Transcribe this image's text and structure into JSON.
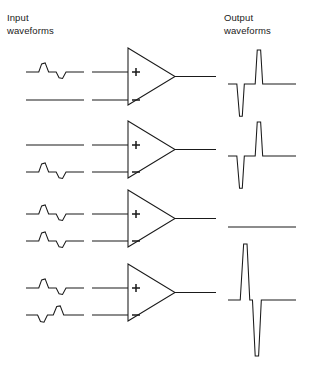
{
  "headers": {
    "input": "Input\nwaveforms",
    "output": "Output\nwaveforms"
  },
  "symbols": {
    "plus": "+",
    "minus": "−",
    "amplifier_name": "operational-amplifier"
  },
  "colors": {
    "stroke": "#1a1a1a",
    "background": "#ffffff",
    "text": "#1a1a1a"
  },
  "chart_data": {
    "type": "line",
    "subtitle": "Differential amplifier response to four input conditions",
    "xlabel": "time",
    "ylabel": "amplitude",
    "grid": false,
    "legend": "none",
    "axis_ranges": {
      "x": [
        0,
        1
      ],
      "y": [
        -1,
        1
      ]
    },
    "rows": [
      {
        "row": 1,
        "label": "signal on non-inverting input only",
        "inputs": [
          {
            "terminal": "+",
            "name": "plus-input-waveform",
            "description": "positive pulse followed by negative pulse",
            "points": [
              [
                0.0,
                0.0
              ],
              [
                0.22,
                0.0
              ],
              [
                0.27,
                0.62
              ],
              [
                0.33,
                0.7
              ],
              [
                0.39,
                0.0
              ],
              [
                0.52,
                0.0
              ],
              [
                0.57,
                -0.45
              ],
              [
                0.63,
                -0.5
              ],
              [
                0.69,
                0.0
              ],
              [
                1.0,
                0.0
              ]
            ]
          },
          {
            "terminal": "-",
            "name": "minus-input-waveform",
            "description": "flat zero line",
            "points": [
              [
                0.0,
                0.0
              ],
              [
                1.0,
                0.0
              ]
            ]
          }
        ],
        "output": {
          "name": "output-waveform",
          "description": "small negative spike, tall positive spike, deep negative spike",
          "points": [
            [
              0.0,
              0.0
            ],
            [
              0.13,
              0.0
            ],
            [
              0.17,
              -0.95
            ],
            [
              0.21,
              -0.95
            ],
            [
              0.24,
              0.0
            ],
            [
              0.4,
              0.0
            ],
            [
              0.43,
              1.0
            ],
            [
              0.48,
              1.0
            ],
            [
              0.51,
              0.0
            ],
            [
              1.0,
              0.0
            ]
          ]
        }
      },
      {
        "row": 2,
        "label": "signal on inverting input only",
        "inputs": [
          {
            "terminal": "+",
            "name": "plus-input-waveform",
            "description": "flat zero line",
            "points": [
              [
                0.0,
                0.0
              ],
              [
                1.0,
                0.0
              ]
            ]
          },
          {
            "terminal": "-",
            "name": "minus-input-waveform",
            "description": "positive pulse followed by negative pulse",
            "points": [
              [
                0.0,
                0.0
              ],
              [
                0.22,
                0.0
              ],
              [
                0.27,
                0.62
              ],
              [
                0.33,
                0.7
              ],
              [
                0.39,
                0.0
              ],
              [
                0.52,
                0.0
              ],
              [
                0.57,
                -0.45
              ],
              [
                0.63,
                -0.5
              ],
              [
                0.69,
                0.0
              ],
              [
                1.0,
                0.0
              ]
            ]
          }
        ],
        "output": {
          "name": "output-waveform",
          "description": "small negative spike, deep negative spike, tall positive spike",
          "points": [
            [
              0.0,
              0.0
            ],
            [
              0.13,
              0.0
            ],
            [
              0.17,
              -0.95
            ],
            [
              0.21,
              -0.95
            ],
            [
              0.24,
              0.0
            ],
            [
              0.4,
              0.0
            ],
            [
              0.43,
              1.0
            ],
            [
              0.48,
              1.0
            ],
            [
              0.51,
              0.0
            ],
            [
              1.0,
              0.0
            ]
          ]
        }
      },
      {
        "row": 3,
        "label": "identical common-mode signals on both inputs",
        "inputs": [
          {
            "terminal": "+",
            "name": "plus-input-waveform",
            "description": "positive pulse followed by negative pulse",
            "points": [
              [
                0.0,
                0.0
              ],
              [
                0.22,
                0.0
              ],
              [
                0.27,
                0.62
              ],
              [
                0.33,
                0.7
              ],
              [
                0.39,
                0.0
              ],
              [
                0.52,
                0.0
              ],
              [
                0.57,
                -0.45
              ],
              [
                0.63,
                -0.5
              ],
              [
                0.69,
                0.0
              ],
              [
                1.0,
                0.0
              ]
            ]
          },
          {
            "terminal": "-",
            "name": "minus-input-waveform",
            "description": "positive pulse followed by negative pulse, identical to plus input",
            "points": [
              [
                0.0,
                0.0
              ],
              [
                0.22,
                0.0
              ],
              [
                0.27,
                0.62
              ],
              [
                0.33,
                0.7
              ],
              [
                0.39,
                0.0
              ],
              [
                0.52,
                0.0
              ],
              [
                0.57,
                -0.45
              ],
              [
                0.63,
                -0.5
              ],
              [
                0.69,
                0.0
              ],
              [
                1.0,
                0.0
              ]
            ]
          }
        ],
        "output": {
          "name": "output-waveform",
          "description": "flat zero line, common-mode signals cancel",
          "points": [
            [
              0.0,
              0.0
            ],
            [
              1.0,
              0.0
            ]
          ]
        }
      },
      {
        "row": 4,
        "label": "opposite differential signals on the two inputs",
        "inputs": [
          {
            "terminal": "+",
            "name": "plus-input-waveform",
            "description": "positive pulse followed by negative pulse",
            "points": [
              [
                0.0,
                0.0
              ],
              [
                0.22,
                0.0
              ],
              [
                0.27,
                0.62
              ],
              [
                0.33,
                0.7
              ],
              [
                0.39,
                0.0
              ],
              [
                0.52,
                0.0
              ],
              [
                0.57,
                -0.45
              ],
              [
                0.63,
                -0.5
              ],
              [
                0.69,
                0.0
              ],
              [
                1.0,
                0.0
              ]
            ]
          },
          {
            "terminal": "-",
            "name": "minus-input-waveform",
            "description": "negative pulse followed by positive pulse, inverted relative to plus input",
            "points": [
              [
                0.0,
                0.0
              ],
              [
                0.2,
                0.0
              ],
              [
                0.25,
                -0.5
              ],
              [
                0.31,
                -0.55
              ],
              [
                0.37,
                0.0
              ],
              [
                0.47,
                0.0
              ],
              [
                0.53,
                0.65
              ],
              [
                0.59,
                0.7
              ],
              [
                0.65,
                0.0
              ],
              [
                1.0,
                0.0
              ]
            ]
          }
        ],
        "output": {
          "name": "output-waveform",
          "description": "very tall positive spike followed by very deep negative spike, maximum differential gain",
          "points": [
            [
              0.0,
              0.0
            ],
            [
              0.18,
              0.0
            ],
            [
              0.23,
              1.0
            ],
            [
              0.28,
              1.0
            ],
            [
              0.32,
              0.0
            ],
            [
              0.36,
              0.0
            ],
            [
              0.4,
              -1.0
            ],
            [
              0.45,
              -1.0
            ],
            [
              0.49,
              0.0
            ],
            [
              1.0,
              0.0
            ]
          ]
        }
      }
    ]
  }
}
